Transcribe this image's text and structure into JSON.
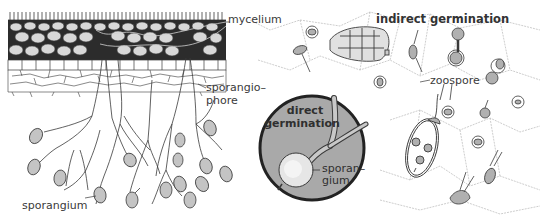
{
  "diagram": {
    "type": "botanical-illustration",
    "labels": {
      "mycelium": "mycelium",
      "sporangiophore_line1": "sporangio–",
      "sporangiophore_line2": "phore",
      "sporangium_left": "sporangium",
      "indirect_germination": "indirect germination",
      "zoospore": "zoospore",
      "direct_line1": "direct",
      "direct_line2": "germination",
      "sporangium_inset_line1": "sporan–",
      "sporangium_inset_line2": "gium"
    },
    "colors": {
      "line": "#3a3a3a",
      "inset_fill": "#a9a9a9",
      "inset_border": "#222222",
      "spore_fill": "#b8b8b8",
      "background": "#ffffff"
    }
  }
}
